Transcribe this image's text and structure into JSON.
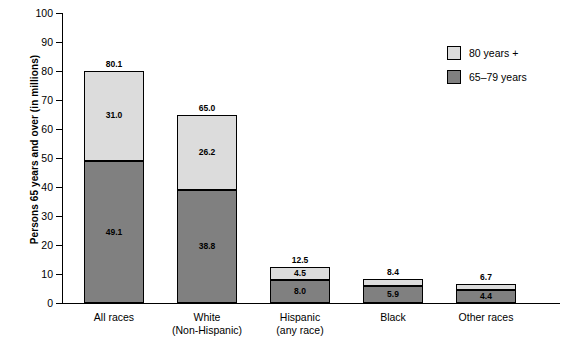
{
  "chart_data": {
    "type": "bar",
    "stacked": true,
    "title": "",
    "xlabel": "",
    "ylabel": "Persons 65 years and over (in millions)",
    "ylim": [
      0,
      100
    ],
    "ytick_step": 10,
    "yticks": [
      "0",
      "10",
      "20",
      "30",
      "40",
      "50",
      "60",
      "70",
      "80",
      "90",
      "100"
    ],
    "grid": false,
    "legend_position": "top-right",
    "categories": [
      {
        "lines": [
          "All races"
        ]
      },
      {
        "lines": [
          "White",
          "(Non-Hispanic)"
        ]
      },
      {
        "lines": [
          "Hispanic",
          "(any race)"
        ]
      },
      {
        "lines": [
          "Black"
        ]
      },
      {
        "lines": [
          "Other races"
        ]
      }
    ],
    "series": [
      {
        "name": "65–79 years",
        "color": "#808080",
        "values": [
          49.1,
          38.8,
          8.0,
          5.9,
          4.4
        ],
        "labels": [
          "49.1",
          "38.8",
          "8.0",
          "5.9",
          "4.4"
        ]
      },
      {
        "name": "80 years +",
        "color": "#dcdcdc",
        "values": [
          31.0,
          26.2,
          4.5,
          2.5,
          2.3
        ],
        "labels": [
          "31.0",
          "26.2",
          "4.5",
          "",
          ""
        ]
      }
    ],
    "totals": [
      80.1,
      65.0,
      12.5,
      8.4,
      6.7
    ],
    "total_labels": [
      "80.1",
      "65.0",
      "12.5",
      "8.4",
      "6.7"
    ]
  },
  "legend": {
    "items": [
      {
        "label": "80 years +",
        "swatch": "light"
      },
      {
        "label": "65–79 years",
        "swatch": "dark"
      }
    ]
  }
}
